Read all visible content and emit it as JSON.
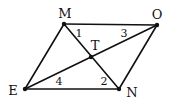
{
  "figure": {
    "type": "parallelogram-with-diagonals",
    "vertices": [
      {
        "id": "M",
        "label": "M",
        "x": 64,
        "y": 24,
        "lx": 65,
        "ly": 18
      },
      {
        "id": "O",
        "label": "O",
        "x": 157,
        "y": 25,
        "lx": 157,
        "ly": 19
      },
      {
        "id": "N",
        "label": "N",
        "x": 119,
        "y": 89,
        "lx": 132,
        "ly": 97
      },
      {
        "id": "E",
        "label": "E",
        "x": 25,
        "y": 89,
        "lx": 13,
        "ly": 95
      }
    ],
    "intersection": {
      "id": "T",
      "label": "T",
      "x": 91,
      "y": 57,
      "lx": 95,
      "ly": 50
    },
    "edges": [
      {
        "from": "M",
        "to": "O"
      },
      {
        "from": "O",
        "to": "N"
      },
      {
        "from": "N",
        "to": "E"
      },
      {
        "from": "E",
        "to": "M"
      },
      {
        "from": "M",
        "to": "N"
      },
      {
        "from": "E",
        "to": "O"
      }
    ],
    "angle_labels": [
      {
        "label": "1",
        "x": 79,
        "y": 37
      },
      {
        "label": "3",
        "x": 124,
        "y": 37
      },
      {
        "label": "4",
        "x": 59,
        "y": 85
      },
      {
        "label": "2",
        "x": 104,
        "y": 85
      }
    ],
    "colors": {
      "stroke": "#111111",
      "background": "#ffffff"
    }
  }
}
